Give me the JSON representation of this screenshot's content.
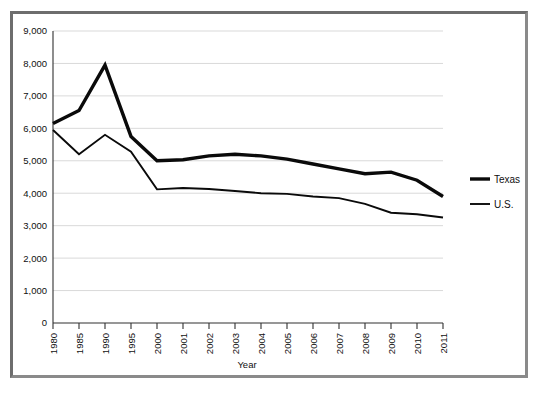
{
  "chart_data": {
    "type": "line",
    "title": "",
    "subtitle": "",
    "xlabel": "Year",
    "ylabel": "",
    "grid": "horizontal",
    "legend_position": "right",
    "ylim": [
      0,
      9000
    ],
    "ytick_step": 1000,
    "categories": [
      "1980",
      "1985",
      "1990",
      "1995",
      "2000",
      "2001",
      "2002",
      "2003",
      "2004",
      "2005",
      "2006",
      "2007",
      "2008",
      "2009",
      "2010",
      "2011"
    ],
    "ytick_labels": [
      "0",
      "1,000",
      "2,000",
      "3,000",
      "4,000",
      "5,000",
      "6,000",
      "7,000",
      "8,000",
      "9,000"
    ],
    "series": [
      {
        "name": "Texas",
        "color": "#0a0a0a",
        "line_width": 3.4,
        "values": [
          6150,
          6550,
          7950,
          5750,
          5000,
          5030,
          5150,
          5200,
          5150,
          5050,
          4900,
          4750,
          4600,
          4650,
          4400,
          3900
        ]
      },
      {
        "name": "U.S.",
        "color": "#0a0a0a",
        "line_width": 1.9,
        "values": [
          5950,
          5200,
          5800,
          5280,
          4120,
          4160,
          4130,
          4070,
          4000,
          3980,
          3900,
          3850,
          3670,
          3400,
          3350,
          3250
        ]
      }
    ]
  },
  "legend": {
    "items": [
      {
        "label": "Texas"
      },
      {
        "label": "U.S."
      }
    ]
  },
  "axes": {
    "x_title": "Year"
  },
  "colors": {
    "frame": "#6d6d6d",
    "grid": "#cfcfcf",
    "axis": "#303030",
    "series": "#0a0a0a",
    "background": "#ffffff"
  }
}
